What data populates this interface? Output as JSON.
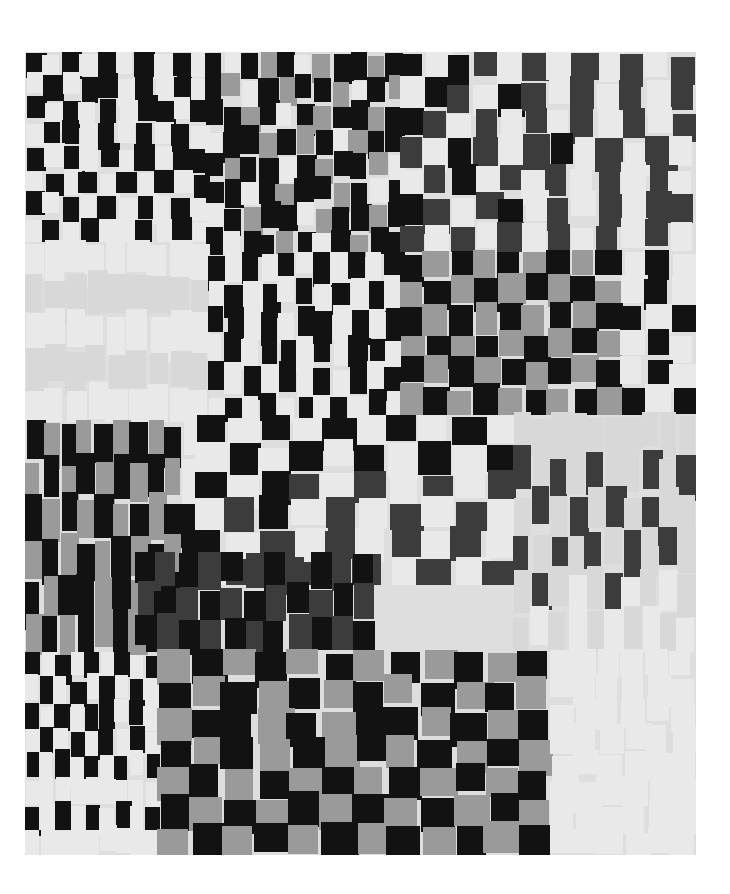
{
  "image": {
    "subject": "Photograph of a black, gray and white patchwork quilt made of staggered rectangular strips",
    "background_color": "#ffffff"
  },
  "palette": {
    "K": "#121212",
    "D": "#3c3c3c",
    "M": "#9a9a9a",
    "L": "#d8d8d8",
    "W": "#e9e9e9"
  },
  "blocks": [
    {
      "name": "block-top-left",
      "rows": [
        "KWKWKWKWKW",
        "WKWKKWKWKW",
        "KWKWKWKKWK",
        "WKKWKWKWKW",
        "KWKWKWKWKK",
        "WKWKWKWKWK",
        "KWKWKWKWKW",
        "WKWKWWKWKW"
      ]
    },
    {
      "name": "block-top-center",
      "rows": [
        "KWKMKWMKKMK",
        "KMWKMKKMWKM",
        "KKMKWKMKKMK",
        "WKKMKMKWMKK",
        "KMKKWKMKKMW",
        "KKWKMKKMKWK",
        "WKMKKWMKKMK",
        "KWKKMKWKMKK"
      ]
    },
    {
      "name": "block-top-right",
      "rows": [
        "KWKDWDWDWDWD",
        "WKDWKDWDWDWD",
        "KDWDWDWDWDWD",
        "DWKDWDKWDWDW",
        "WDKWDWDWDWDW",
        "KDWDKWDWDWDD",
        "DWDWDWDWDWDW"
      ]
    },
    {
      "name": "block-left-pale",
      "rows": [
        "WWWWWWWWW",
        "LLLLLLLLL",
        "WWWWWWWWW",
        "LLLLLLLLL",
        "WWWWWWWWW"
      ]
    },
    {
      "name": "block-mid-center",
      "rows": [
        "KWKWKWKWKWK",
        "WKWKWKWKWKW",
        "KKWKWKKWKWK",
        "WKWKKWKWKKW",
        "KWKWKWKWKWK",
        "WKWKWKWKWKW"
      ]
    },
    {
      "name": "block-mid-right-gray",
      "rows": [
        "KMKMKMKMKWKW",
        "MKMKMKMKMWKW",
        "KMKMKMKMKKWK",
        "MKMKMKMKMWKW",
        "KMKMKMKMKWKW",
        "MKMKMKMKMKWK"
      ]
    },
    {
      "name": "block-row3-left",
      "rows": [
        "KMKMKMKMKW",
        "MKMKMKMKMW",
        "KMKMKMKMKK",
        "MKMKMKMKMK",
        "KMKKMKMKKD",
        "MKMKMKMKDK"
      ]
    },
    {
      "name": "block-row3-center",
      "rows": [
        "KWKWKWKWKW",
        "WKWKWKWKWK",
        "KWKDWDWDWD",
        "WDKWDWDWDW",
        "KWDWDWDWDW",
        "WDWDWDWDWD"
      ]
    },
    {
      "name": "block-row3-right",
      "rows": [
        "LLLLLLLLLL",
        "DLDLDLLDLD",
        "LDLDLDLDLL",
        "DLDLDLDLDL",
        "LDLWLDWLWL",
        "LWLWLWLWLW"
      ]
    },
    {
      "name": "block-row3-dark",
      "rows": [
        "KDKDKDKDKDK",
        "DKDKDKDKDKD",
        "KDKDKDKDKDK"
      ]
    },
    {
      "name": "block-bottom-left",
      "rows": [
        "KWKWKWKWK",
        "WKWKWKWKW",
        "KWKWKKWKW",
        "WKWKWKWKW",
        "KWKWKWKWK",
        "WWWWWWWWW",
        "KWKWKWKWK",
        "WWWWWWWWW"
      ]
    },
    {
      "name": "block-bottom-center",
      "rows": [
        "MKMKMKMKMKMK",
        "KMKMKMKMKMKM",
        "MKKMKMKKMKMK",
        "KMKMKMKMKMKM",
        "MKMKMKMKMKMK",
        "KMKMKMKMKMKM",
        "MKMKMKMKMKMK"
      ]
    },
    {
      "name": "block-bottom-right-pale",
      "rows": [
        "WWWWWW",
        "WWWWWW",
        "WWWWWW",
        "WWWWWW",
        "WWWWWW",
        "WWWWWW",
        "WWWWWW",
        "WWWWWW"
      ]
    }
  ]
}
